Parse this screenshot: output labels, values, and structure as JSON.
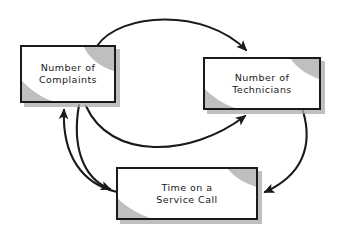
{
  "diagram": {
    "background_color": "#ffffff",
    "node_border_color": "#1a1a1a",
    "node_fill_color": "#ffffff",
    "shadow_color": "#aaaaaa",
    "accent_color": "#b3b3b3",
    "arrow_color": "#1a1a1a",
    "nodes": [
      {
        "id": "complaints",
        "label": "Number of\nComplaints",
        "line1": "Number of",
        "line2": "Complaints"
      },
      {
        "id": "technicians",
        "label": "Number of\nTechnicians",
        "line1": "Number of",
        "line2": "Technicians"
      },
      {
        "id": "time",
        "label": "Time on a\nService Call",
        "line1": "Time on a",
        "line2": "Service Call"
      }
    ],
    "arrows": [
      {
        "id": "complaints-to-technicians-outer",
        "from": "complaints",
        "to": "technicians",
        "direction": "clockwise-top"
      },
      {
        "id": "technicians-to-time",
        "from": "technicians",
        "to": "time",
        "direction": "clockwise-right"
      },
      {
        "id": "time-to-complaints",
        "from": "time",
        "to": "complaints",
        "direction": "clockwise-left"
      },
      {
        "id": "complaints-to-time",
        "from": "complaints",
        "to": "time",
        "direction": "counter-left-down"
      },
      {
        "id": "time-to-technicians-inner",
        "from": "time",
        "to": "technicians",
        "direction": "inner-up-right"
      }
    ]
  }
}
